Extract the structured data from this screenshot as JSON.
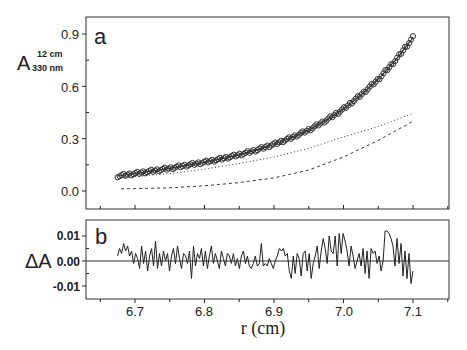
{
  "chart_data": [
    {
      "panel": "a",
      "type": "scatter",
      "panel_label": "a",
      "title": "",
      "xlabel": "r (cm)",
      "ylabel": "A",
      "ylabel_superscript": "12 cm",
      "ylabel_subscript": "330 nm",
      "xlim": [
        6.63,
        7.15
      ],
      "ylim": [
        -0.1,
        1.0
      ],
      "yticks": [
        0.0,
        0.3,
        0.6,
        0.9
      ],
      "ytick_labels": [
        "0.0",
        "0.3",
        "0.6",
        "0.9"
      ],
      "grid": false,
      "series": [
        {
          "name": "data",
          "style": "open-circles",
          "x": [
            6.675,
            6.7,
            6.725,
            6.75,
            6.775,
            6.8,
            6.825,
            6.85,
            6.875,
            6.9,
            6.925,
            6.95,
            6.975,
            7.0,
            7.025,
            7.05,
            7.075,
            7.1
          ],
          "values": [
            0.086,
            0.1,
            0.115,
            0.13,
            0.148,
            0.165,
            0.185,
            0.208,
            0.235,
            0.268,
            0.305,
            0.35,
            0.405,
            0.47,
            0.55,
            0.64,
            0.75,
            0.88
          ]
        },
        {
          "name": "fit",
          "style": "solid",
          "x": [
            6.675,
            6.7,
            6.725,
            6.75,
            6.775,
            6.8,
            6.825,
            6.85,
            6.875,
            6.9,
            6.925,
            6.95,
            6.975,
            7.0,
            7.025,
            7.05,
            7.075,
            7.1
          ],
          "values": [
            0.086,
            0.1,
            0.115,
            0.13,
            0.148,
            0.165,
            0.185,
            0.208,
            0.235,
            0.268,
            0.305,
            0.35,
            0.405,
            0.47,
            0.55,
            0.64,
            0.75,
            0.88
          ]
        },
        {
          "name": "component-dotted",
          "style": "dotted",
          "x": [
            6.68,
            6.75,
            6.8,
            6.85,
            6.9,
            6.95,
            7.0,
            7.05,
            7.1
          ],
          "values": [
            0.075,
            0.1,
            0.125,
            0.158,
            0.195,
            0.245,
            0.31,
            0.37,
            0.445
          ]
        },
        {
          "name": "component-dashed",
          "style": "dashed",
          "x": [
            6.68,
            6.75,
            6.8,
            6.85,
            6.9,
            6.95,
            7.0,
            7.05,
            7.1
          ],
          "values": [
            0.012,
            0.018,
            0.03,
            0.048,
            0.075,
            0.12,
            0.195,
            0.29,
            0.4
          ]
        }
      ]
    },
    {
      "panel": "b",
      "type": "line",
      "panel_label": "b",
      "title": "",
      "xlabel": "r (cm)",
      "ylabel": "ΔA",
      "xlim": [
        6.63,
        7.15
      ],
      "ylim": [
        -0.015,
        0.016
      ],
      "xticks": [
        6.7,
        6.8,
        6.9,
        7.0,
        7.1
      ],
      "xtick_labels": [
        "6.7",
        "6.8",
        "6.9",
        "7.0",
        "7.1"
      ],
      "yticks": [
        -0.01,
        0.0,
        0.01
      ],
      "ytick_labels": [
        "-0.01",
        "0.00",
        "0.01"
      ],
      "grid": false,
      "zero_line": true,
      "series": [
        {
          "name": "residuals",
          "x_start": 6.675,
          "x_end": 7.1,
          "values": [
            0.002,
            0.005,
            0.003,
            0.007,
            0.004,
            0.006,
            0.002,
            0.004,
            -0.001,
            0.003,
            0.001,
            -0.003,
            0.006,
            -0.001,
            0.004,
            -0.004,
            0.002,
            0.005,
            -0.002,
            0.008,
            -0.003,
            0.003,
            -0.002,
            0.004,
            0.0,
            0.003,
            -0.004,
            0.002,
            0.005,
            -0.001,
            0.006,
            0.001,
            -0.003,
            0.003,
            0.002,
            -0.001,
            0.004,
            -0.007,
            0.006,
            -0.002,
            0.003,
            0.001,
            0.005,
            -0.002,
            0.004,
            -0.003,
            0.002,
            0.006,
            -0.001,
            0.003,
            0.0,
            -0.003,
            0.004,
            0.001,
            -0.002,
            0.003,
            0.002,
            -0.001,
            0.003,
            -0.002,
            0.001,
            -0.003,
            0.002,
            0.004,
            -0.001,
            0.002,
            -0.002,
            -0.003,
            -0.001,
            0.002,
            -0.002,
            -0.001,
            0.007,
            -0.002,
            -0.001,
            -0.002,
            0.001,
            -0.001,
            -0.003,
            0.0,
            0.002,
            0.005,
            0.004,
            0.005,
            0.002,
            0.003,
            -0.004,
            -0.007,
            0.002,
            -0.005,
            0.003,
            0.001,
            -0.006,
            0.003,
            0.004,
            -0.004,
            0.003,
            -0.007,
            -0.001,
            0.002,
            0.006,
            -0.003,
            0.004,
            0.009,
            0.005,
            -0.001,
            0.01,
            0.004,
            0.003,
            0.01,
            -0.002,
            0.011,
            0.003,
            0.011,
            0.008,
            0.004,
            -0.002,
            0.006,
            0.002,
            -0.003,
            0.0,
            0.003,
            -0.002,
            0.005,
            -0.005,
            0.004,
            -0.007,
            0.005,
            0.003,
            0.004,
            -0.001,
            0.002,
            -0.004,
            0.0,
            0.012,
            0.012,
            0.011,
            0.009,
            0.006,
            -0.002,
            0.009,
            -0.001,
            0.007,
            -0.006,
            0.004,
            -0.007,
            0.003,
            -0.009,
            -0.004
          ]
        }
      ]
    }
  ],
  "axis": {
    "panel_a": {
      "label_main": "A",
      "label_sup": "12 cm",
      "label_sub": "330 nm",
      "panel_letter": "a",
      "yticks": [
        "0.9",
        "0.6",
        "0.3",
        "0.0"
      ]
    },
    "panel_b": {
      "label_main": "ΔA",
      "panel_letter": "b",
      "yticks": [
        "0.01",
        "0.00",
        "-0.01"
      ]
    },
    "x": {
      "label": "r (cm)",
      "ticks": [
        "6.7",
        "6.8",
        "6.9",
        "7.0",
        "7.1"
      ]
    }
  },
  "colors": {
    "ink": "#222222",
    "background": "#ffffff",
    "zero_line": "#333333"
  }
}
